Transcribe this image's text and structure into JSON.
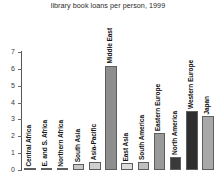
{
  "chart_data": {
    "type": "bar",
    "title": "library book loans per person, 1999",
    "xlabel": "",
    "ylabel": "",
    "ylim": [
      0,
      7
    ],
    "yticks": [
      0,
      1,
      2,
      3,
      4,
      5,
      6,
      7
    ],
    "grid": false,
    "legend": "none",
    "categories": [
      "Central Africa",
      "E. and S. Africa",
      "Northern Africa",
      "South Asia",
      "Asia-Pacific",
      "Middle East",
      "East Asia",
      "South America",
      "Eastern Europe",
      "North America",
      "Western Europe",
      "Japan"
    ],
    "values": [
      0.03,
      0.03,
      0.05,
      0.35,
      0.45,
      6.2,
      0.4,
      0.5,
      2.2,
      0.75,
      3.5,
      3.2
    ],
    "bar_colors": [
      "#b9b9b9",
      "#b9b9b9",
      "#b9b9b9",
      "#c8c8c8",
      "#d0d0d0",
      "#8e8e8e",
      "#dcdcdc",
      "#c0c0c0",
      "#9a9a9a",
      "#3a3a3a",
      "#2e2e2e",
      "#a8a8a8"
    ]
  },
  "axis": {
    "tick_labels": [
      "0",
      "1",
      "2",
      "3",
      "4",
      "5",
      "6",
      "7"
    ]
  }
}
